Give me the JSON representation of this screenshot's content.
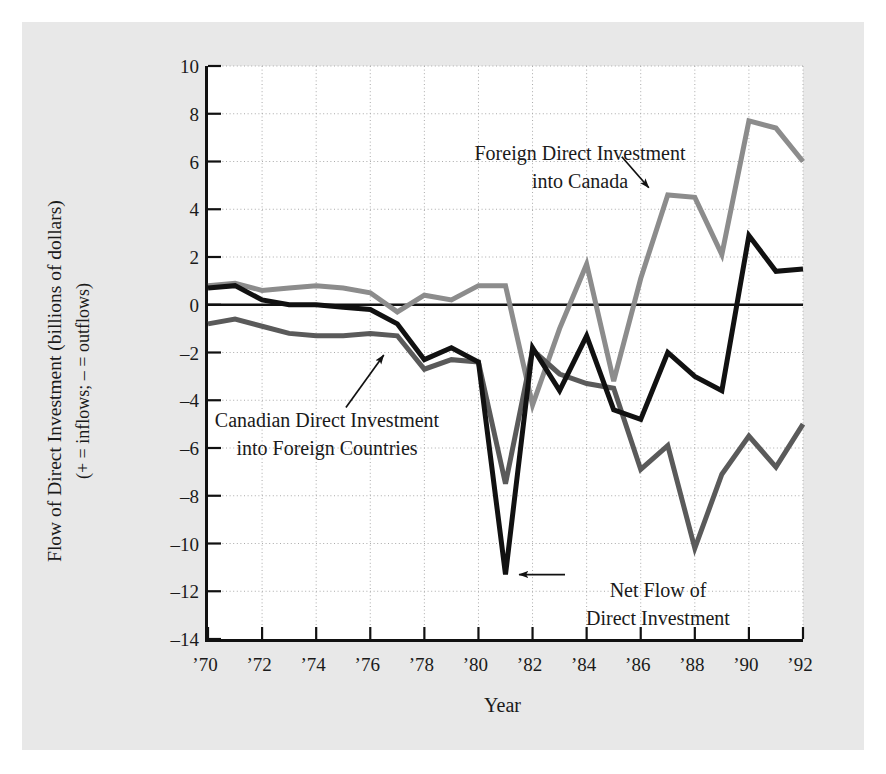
{
  "chart_data": {
    "type": "line",
    "title": "",
    "xlabel": "Year",
    "ylabel": "Flow of Direct Investment (billions of dollars)",
    "ylabel_line2": "(+ = inflows; – = outflows)",
    "x": [
      1970,
      1971,
      1972,
      1973,
      1974,
      1975,
      1976,
      1977,
      1978,
      1979,
      1980,
      1981,
      1982,
      1983,
      1984,
      1985,
      1986,
      1987,
      1988,
      1989,
      1990,
      1991,
      1992
    ],
    "xlim": [
      1970,
      1992
    ],
    "ylim": [
      -14,
      10
    ],
    "xticks": [
      1970,
      1972,
      1974,
      1976,
      1978,
      1980,
      1982,
      1984,
      1986,
      1988,
      1990,
      1992
    ],
    "xticklabels": [
      "’70",
      "’72",
      "’74",
      "’76",
      "’78",
      "’80",
      "’82",
      "’84",
      "’86",
      "’88",
      "’90",
      "’92"
    ],
    "yticks": [
      10,
      8,
      6,
      4,
      2,
      0,
      -2,
      -4,
      -6,
      -8,
      -10,
      -12,
      -14
    ],
    "yticklabels": [
      "10",
      "8",
      "6",
      "4",
      "2",
      "0",
      "–2",
      "–4",
      "–6",
      "–8",
      "–10",
      "–12",
      "–14"
    ],
    "grid": true,
    "grid_style": "dotted",
    "zero_line": true,
    "legend_position": "annotations",
    "series": [
      {
        "name": "Foreign Direct Investment into Canada",
        "color": "#8c8c8c",
        "width": 5,
        "values": [
          0.8,
          0.9,
          0.6,
          0.7,
          0.8,
          0.7,
          0.5,
          -0.3,
          0.4,
          0.2,
          0.8,
          0.8,
          -4.2,
          -1.0,
          1.7,
          -3.2,
          1.1,
          4.6,
          4.5,
          2.1,
          7.7,
          7.4,
          6.0
        ]
      },
      {
        "name": "Canadian Direct Investment into Foreign Countries",
        "color": "#5a5a5a",
        "width": 5,
        "values": [
          -0.8,
          -0.6,
          -0.9,
          -1.2,
          -1.3,
          -1.3,
          -1.2,
          -1.3,
          -2.7,
          -2.3,
          -2.4,
          -7.5,
          -1.9,
          -2.9,
          -3.3,
          -3.5,
          -6.9,
          -5.9,
          -10.2,
          -7.1,
          -5.5,
          -6.8,
          -5.0
        ]
      },
      {
        "name": "Net Flow of Direct Investment",
        "color": "#111111",
        "width": 5,
        "values": [
          0.7,
          0.8,
          0.2,
          0.0,
          0.0,
          -0.1,
          -0.2,
          -0.8,
          -2.3,
          -1.8,
          -2.4,
          -11.3,
          -1.8,
          -3.6,
          -1.3,
          -4.4,
          -4.8,
          -2.0,
          -3.0,
          -3.6,
          2.9,
          1.4,
          1.5
        ]
      }
    ],
    "annotations": [
      {
        "name": "fdi-into-canada",
        "text": "Foreign Direct Investment\ninto Canada",
        "arrow_from": [
          1985.3,
          6.2
        ],
        "arrow_to": [
          1986.3,
          4.9
        ]
      },
      {
        "name": "canadian-direct-investment",
        "text": "Canadian Direct Investment\ninto Foreign Countries",
        "arrow_from": [
          1975.1,
          -4.3
        ],
        "arrow_to": [
          1976.5,
          -2.1
        ]
      },
      {
        "name": "net-flow",
        "text": "Net Flow of\nDirect Investment",
        "arrow_from": [
          1983.2,
          -11.3
        ],
        "arrow_to": [
          1981.5,
          -11.3
        ]
      }
    ]
  },
  "figure": {
    "background_color": "#e8e8e8",
    "plot_background_color": "#ffffff",
    "axis_color": "#111111",
    "grid_color": "#aaaaaa"
  }
}
